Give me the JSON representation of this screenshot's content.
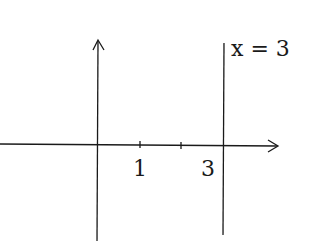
{
  "diagram": {
    "type": "coordinate-plane",
    "x_axis": {
      "ticks": [
        1,
        2,
        3
      ],
      "tick_labels": [
        "1",
        "3"
      ]
    },
    "y_axis": {
      "ticks": []
    },
    "lines": [
      {
        "equation": "x = 3",
        "label": "x = 3"
      }
    ],
    "labels": {
      "tick1": "1",
      "tick3": "3",
      "line": "x = 3"
    },
    "colors": {
      "stroke": "#1a1a1a",
      "background": "#ffffff"
    }
  }
}
